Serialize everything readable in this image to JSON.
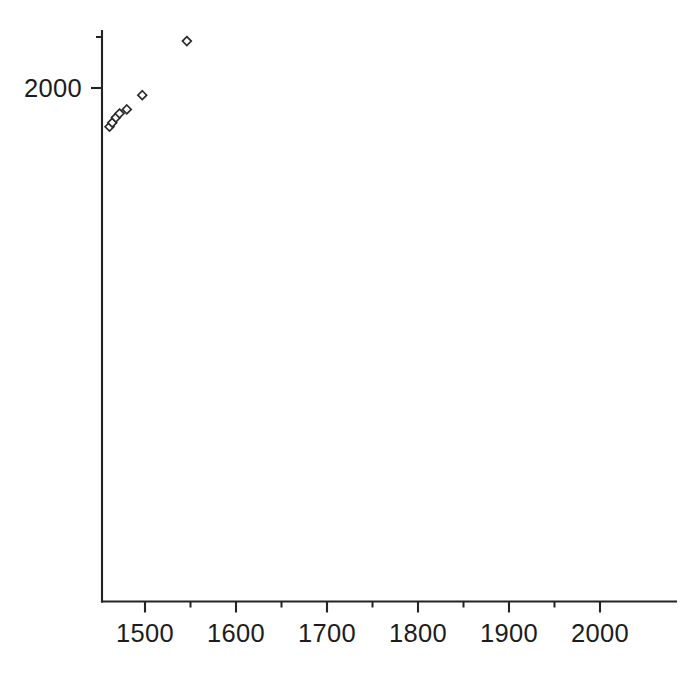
{
  "chart_data": {
    "type": "scatter",
    "title": "",
    "subtitle": "",
    "xlabel": "",
    "ylabel": "",
    "xlim": [
      1450,
      2010
    ],
    "ylim": [
      1490,
      2050
    ],
    "grid": false,
    "legend": null,
    "marker": "open-diamond",
    "marker_color": "#2a2a2a",
    "xticks": [
      1500,
      1600,
      1700,
      1800,
      1900,
      2000
    ],
    "xtick_labels": [
      "1500",
      "1600",
      "1700",
      "1800",
      "1900",
      "2000"
    ],
    "xticks_minor": [
      1550,
      1650,
      1750,
      1850,
      1950
    ],
    "yticks": [
      1500,
      1600,
      1700,
      1800,
      1900,
      2000
    ],
    "ytick_labels": [
      "1500",
      "1600",
      "1700",
      "1800",
      "1900",
      "2000"
    ],
    "yticks_minor": [
      1550,
      1650,
      1750,
      1850,
      1950
    ],
    "axis_spines": [
      "left",
      "bottom"
    ],
    "points": [
      {
        "x": 1461,
        "y": 2038
      },
      {
        "x": 1464,
        "y": 2034
      },
      {
        "x": 1468,
        "y": 2029
      },
      {
        "x": 1472,
        "y": 2025
      },
      {
        "x": 1480,
        "y": 2021
      },
      {
        "x": 1497,
        "y": 2007
      },
      {
        "x": 1546,
        "y": 1954
      },
      {
        "x": 1675,
        "y": 1824
      },
      {
        "x": 2000,
        "y": 1500
      }
    ],
    "x_values": [
      1461,
      1464,
      1468,
      1472,
      1480,
      1497,
      1546,
      1675,
      2000
    ],
    "y_values": [
      2038,
      2034,
      2029,
      2025,
      2021,
      2007,
      1954,
      1824,
      1500
    ],
    "n_points": 9
  },
  "axes": {
    "x_axis_name": "x-axis",
    "y_axis_name": "y-axis"
  },
  "colors": {
    "background": "#ffffff",
    "axis": "#232323",
    "text": "#1c1c1c",
    "marker_stroke": "#2a2a2a",
    "marker_fill": "#ffffff"
  }
}
